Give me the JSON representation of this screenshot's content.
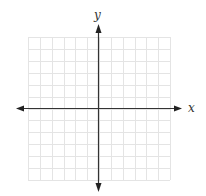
{
  "diagram": {
    "type": "coordinate-plane",
    "axis_labels": {
      "x": "x",
      "y": "y"
    },
    "grid": {
      "columns": 12,
      "rows": 12,
      "left": 28,
      "top": 37,
      "right": 170,
      "bottom": 180
    },
    "origin": {
      "x": 98,
      "y": 108
    },
    "colors": {
      "grid": "#e4e4e4",
      "axis": "#333333",
      "background": "#ffffff"
    }
  }
}
